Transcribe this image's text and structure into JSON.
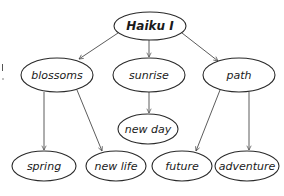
{
  "diagram": {
    "type": "tree",
    "title": "Haiku I",
    "colors": {
      "stroke": "#2a2a2a",
      "edge": "#4a4a4a",
      "background": "#ffffff",
      "text": "#1a1a1a"
    },
    "nodes": [
      {
        "id": "root",
        "label": "Haiku I",
        "cx": 150,
        "cy": 26,
        "rx": 36,
        "ry": 14
      },
      {
        "id": "blossoms",
        "label": "blossoms",
        "cx": 57,
        "cy": 75,
        "rx": 36,
        "ry": 17
      },
      {
        "id": "sunrise",
        "label": "sunrise",
        "cx": 149,
        "cy": 75,
        "rx": 36,
        "ry": 17
      },
      {
        "id": "path",
        "label": "path",
        "cx": 239,
        "cy": 75,
        "rx": 36,
        "ry": 17
      },
      {
        "id": "newday",
        "label": "new day",
        "cx": 148,
        "cy": 129,
        "rx": 30,
        "ry": 15
      },
      {
        "id": "spring",
        "label": "spring",
        "cx": 44,
        "cy": 166,
        "rx": 32,
        "ry": 15
      },
      {
        "id": "newlife",
        "label": "new life",
        "cx": 116,
        "cy": 166,
        "rx": 30,
        "ry": 15
      },
      {
        "id": "future",
        "label": "future",
        "cx": 182,
        "cy": 166,
        "rx": 30,
        "ry": 15
      },
      {
        "id": "adventure",
        "label": "adventure",
        "cx": 247,
        "cy": 166,
        "rx": 32,
        "ry": 15
      }
    ],
    "edges": [
      {
        "from": "Haiku I",
        "to": "blossoms"
      },
      {
        "from": "Haiku I",
        "to": "sunrise"
      },
      {
        "from": "Haiku I",
        "to": "path"
      },
      {
        "from": "blossoms",
        "to": "spring"
      },
      {
        "from": "blossoms",
        "to": "new life"
      },
      {
        "from": "sunrise",
        "to": "new day"
      },
      {
        "from": "path",
        "to": "future"
      },
      {
        "from": "path",
        "to": "adventure"
      }
    ]
  }
}
